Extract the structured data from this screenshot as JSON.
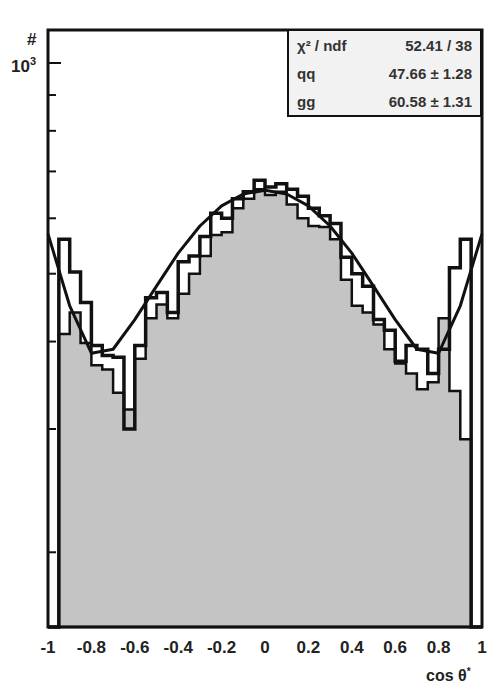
{
  "chart_data": {
    "type": "bar",
    "subtype": "histogram_with_fit",
    "title": "",
    "xlabel": "cos θ*",
    "ylabel": "#",
    "xlim": [
      -1,
      1
    ],
    "yscale": "log",
    "ylim": [
      156,
      1130
    ],
    "x_ticks": [
      "-1",
      "-0.8",
      "-0.6",
      "-0.4",
      "-0.2",
      "0",
      "0.2",
      "0.4",
      "0.6",
      "0.8",
      "1"
    ],
    "y_tick_labels": [
      "10³"
    ],
    "y_minor_ticks": [
      200,
      300,
      400,
      500,
      600,
      700,
      800,
      900
    ],
    "bins": 40,
    "bin_edges_start": -1,
    "bin_width": 0.05,
    "series": [
      {
        "name": "data",
        "style": "outline",
        "values": [
          156,
          560,
          503,
          455,
          395,
          382,
          380,
          300,
          395,
          462,
          470,
          440,
          520,
          530,
          565,
          610,
          600,
          640,
          655,
          680,
          665,
          672,
          660,
          645,
          620,
          605,
          590,
          528,
          500,
          480,
          430,
          415,
          375,
          395,
          390,
          360,
          390,
          510,
          560,
          156
        ]
      },
      {
        "name": "MC (gray fill)",
        "style": "filled",
        "color": "#c4c4c4",
        "values": [
          156,
          410,
          440,
          398,
          370,
          365,
          338,
          320,
          378,
          432,
          452,
          432,
          468,
          500,
          530,
          568,
          573,
          620,
          640,
          660,
          648,
          655,
          628,
          600,
          585,
          583,
          560,
          490,
          450,
          440,
          423,
          390,
          372,
          360,
          342,
          350,
          432,
          340,
          290,
          156
        ]
      },
      {
        "name": "fit",
        "style": "line",
        "x": [
          -1,
          -0.9,
          -0.8,
          -0.7,
          -0.6,
          -0.5,
          -0.4,
          -0.3,
          -0.2,
          -0.1,
          0,
          0.1,
          0.2,
          0.3,
          0.4,
          0.5,
          0.6,
          0.7,
          0.8,
          0.9,
          1
        ],
        "values": [
          570,
          450,
          385,
          390,
          430,
          480,
          535,
          585,
          625,
          650,
          658,
          650,
          625,
          585,
          535,
          480,
          430,
          390,
          385,
          450,
          570
        ]
      }
    ],
    "legend": {
      "position": "top-right",
      "rows": [
        {
          "key": "χ² / ndf",
          "value": "52.41 / 38"
        },
        {
          "key": "qq",
          "value": "47.66 ± 1.28"
        },
        {
          "key": "gg",
          "value": "60.58 ± 1.31"
        }
      ]
    },
    "grid": false
  },
  "axis": {
    "y_title": "#",
    "y_major_label": "10",
    "y_major_exp": "3",
    "x_title": "cos θ",
    "x_title_sup": "*"
  }
}
